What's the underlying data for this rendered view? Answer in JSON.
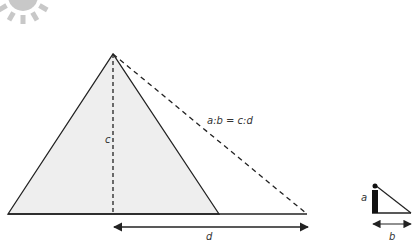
{
  "diagram": {
    "labels": {
      "equation": "a:b = c:d",
      "pyramid_height": "c",
      "pyramid_shadow": "d",
      "person_height": "a",
      "person_shadow": "b"
    },
    "elements": [
      "sun",
      "pyramid",
      "pyramid-height-line",
      "sun-ray-to-pyramid-shadow",
      "pyramid-shadow-arrow",
      "person",
      "person-shadow-triangle",
      "person-shadow-arrow"
    ],
    "colors": {
      "sun": "#c8c8c8",
      "pyramid_fill": "#eeeeee",
      "line": "#222222"
    }
  }
}
